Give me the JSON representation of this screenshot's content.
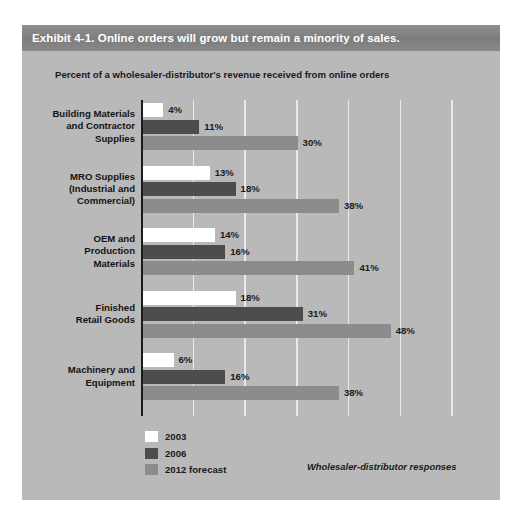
{
  "exhibit": {
    "title": "Exhibit 4-1. Online orders will grow but remain a minority of sales.",
    "subtitle": "Percent of a wholesaler-distributor's revenue received from online orders",
    "source_note": "Wholesaler-distributor responses",
    "title_bar_color": "#7d7d7d",
    "panel_color": "#b9b9b9"
  },
  "legend": {
    "items": [
      {
        "label": "2003",
        "color": "#ffffff",
        "swatch_name": "legend-swatch-2003"
      },
      {
        "label": "2006",
        "color": "#4d4d4d",
        "swatch_name": "legend-swatch-2006"
      },
      {
        "label": "2012 forecast",
        "color": "#8c8c8c",
        "swatch_name": "legend-swatch-2012"
      }
    ]
  },
  "chart_data": {
    "type": "bar",
    "orientation": "horizontal",
    "title": "Exhibit 4-1. Online orders will grow but remain a minority of sales.",
    "subtitle": "Percent of a wholesaler-distributor's revenue received from online orders",
    "xlabel": "",
    "ylabel": "",
    "xlim": [
      0,
      60
    ],
    "xticks": [
      0,
      10,
      20,
      30,
      40,
      50,
      60
    ],
    "grid": "vertical",
    "tick_labels_visible": false,
    "legend_position": "bottom-left",
    "value_label_suffix": "%",
    "categories": [
      "Building Materials and Contractor Supplies",
      "MRO Supplies (Industrial and Commercial)",
      "OEM and Production Materials",
      "Finished Retail Goods",
      "Machinery and Equipment"
    ],
    "category_lines": [
      [
        "Building Materials",
        "and Contractor",
        "Supplies"
      ],
      [
        "MRO Supplies",
        "(Industrial and",
        "Commercial)"
      ],
      [
        "OEM and",
        "Production",
        "Materials"
      ],
      [
        "Finished",
        "Retail Goods"
      ],
      [
        "Machinery and",
        "Equipment"
      ]
    ],
    "series": [
      {
        "name": "2003",
        "color": "#ffffff",
        "values": [
          4,
          13,
          14,
          18,
          6
        ],
        "labels": [
          "4%",
          "13%",
          "14%",
          "18%",
          "6%"
        ]
      },
      {
        "name": "2006",
        "color": "#4d4d4d",
        "values": [
          11,
          18,
          16,
          31,
          16
        ],
        "labels": [
          "11%",
          "18%",
          "16%",
          "31%",
          "16%"
        ]
      },
      {
        "name": "2012 forecast",
        "color": "#8c8c8c",
        "values": [
          30,
          38,
          41,
          48,
          38
        ],
        "labels": [
          "30%",
          "38%",
          "41%",
          "48%",
          "38%"
        ]
      }
    ],
    "annotation": "Wholesaler-distributor responses"
  }
}
